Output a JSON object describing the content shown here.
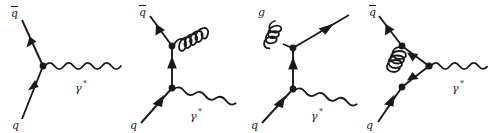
{
  "figure": {
    "title": "",
    "background_color": "#ffffff",
    "line_color": "#1a1a1a",
    "label_color": "#1a1a1a",
    "width": 489,
    "height": 133,
    "diagram_count": 4
  },
  "diagrams": [
    {
      "id": "lo-drell-yan",
      "name": "leading-order-quark-antiquark-annihilation",
      "labels": {
        "antiquark": "q",
        "antiquark_bar": "̅",
        "quark": "q",
        "photon": "γ",
        "photon_star": "*"
      },
      "lines": {
        "antiquark_in": "fermion",
        "quark_in": "fermion",
        "photon_out": "wavy"
      }
    },
    {
      "id": "real-gluon-emission-final-state",
      "name": "final-state-gluon-radiation",
      "labels": {
        "antiquark": "q",
        "antiquark_bar": "̅",
        "quark": "q",
        "photon": "γ",
        "photon_star": "*"
      },
      "lines": {
        "antiquark_out": "fermion",
        "quark_in": "fermion",
        "quark_propagator": "fermion",
        "gluon_out": "coil",
        "photon_out": "wavy"
      }
    },
    {
      "id": "gluon-initiated-compton",
      "name": "quark-gluon-compton-scattering",
      "labels": {
        "gluon": "g",
        "quark": "q",
        "photon": "γ",
        "photon_star": "*"
      },
      "lines": {
        "gluon_in": "coil",
        "quark_out": "fermion",
        "quark_propagator": "fermion",
        "quark_in": "fermion",
        "photon_out": "wavy"
      }
    },
    {
      "id": "virtual-vertex-correction",
      "name": "one-loop-gluon-vertex-correction",
      "labels": {
        "antiquark": "q",
        "antiquark_bar": "̅",
        "quark": "q",
        "photon": "γ",
        "photon_star": "*"
      },
      "lines": {
        "antiquark_out": "fermion",
        "quark_in": "fermion",
        "gluon_loop": "coil",
        "photon_out": "wavy"
      }
    }
  ]
}
